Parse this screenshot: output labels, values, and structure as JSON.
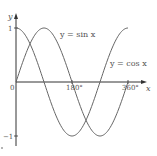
{
  "chart_data": {
    "type": "line",
    "title": "",
    "xlabel": "x",
    "ylabel": "y",
    "origin_label": "0",
    "x_tick_labels": [
      "180°",
      "360°"
    ],
    "y_tick_labels": [
      "1",
      "−1"
    ],
    "xlim": [
      0,
      360
    ],
    "ylim": [
      -1,
      1
    ],
    "grid": false,
    "legend": "inline annotations",
    "series": [
      {
        "name": "y = sin x",
        "x": [
          0,
          45,
          90,
          135,
          180,
          225,
          270,
          315,
          360
        ],
        "values": [
          0,
          0.707,
          1,
          0.707,
          0,
          -0.707,
          -1,
          -0.707,
          0
        ]
      },
      {
        "name": "y = cos x",
        "x": [
          0,
          45,
          90,
          135,
          180,
          225,
          270,
          315,
          360
        ],
        "values": [
          1,
          0.707,
          0,
          -0.707,
          -1,
          -0.707,
          0,
          0.707,
          1
        ]
      }
    ],
    "annotations": {
      "sin_label": "y = sin x",
      "cos_label": "y = cos x"
    }
  },
  "colors": {
    "axis": "#333333",
    "curve": "#666666",
    "text": "#555555"
  }
}
